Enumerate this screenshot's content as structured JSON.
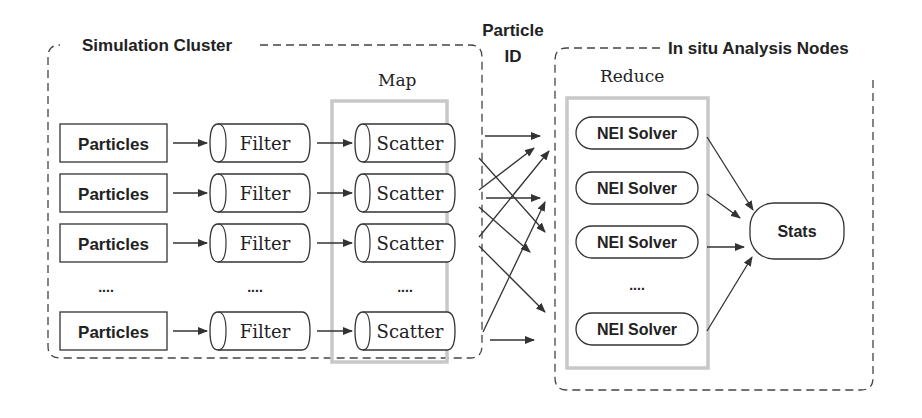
{
  "diagram": {
    "simulation_cluster": {
      "label": "Simulation Cluster",
      "map_label": "Map",
      "rows": [
        {
          "source": "Particles",
          "filter": "Filter",
          "scatter": "Scatter"
        },
        {
          "source": "Particles",
          "filter": "Filter",
          "scatter": "Scatter"
        },
        {
          "source": "Particles",
          "filter": "Filter",
          "scatter": "Scatter"
        },
        {
          "source": "Particles",
          "filter": "Filter",
          "scatter": "Scatter"
        }
      ],
      "ellipsis": "...."
    },
    "particle_id_label": {
      "line1": "Particle",
      "line2": "ID"
    },
    "analysis_nodes": {
      "label": "In situ Analysis Nodes",
      "reduce_label": "Reduce",
      "solvers": [
        "NEI Solver",
        "NEI Solver",
        "NEI Solver",
        "NEI Solver"
      ],
      "ellipsis": "....",
      "stats": "Stats"
    },
    "colors": {
      "stroke": "#333333",
      "text": "#222222",
      "group_box": "#c8c8c8",
      "background": "#ffffff"
    }
  }
}
